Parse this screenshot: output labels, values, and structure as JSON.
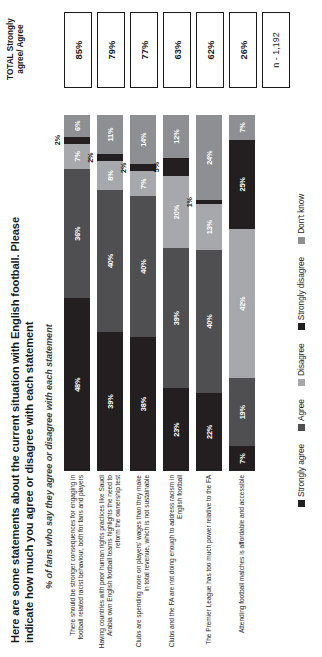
{
  "header": {
    "title": "Here are some statements about the current situation with English football. Please indicate how much you agree or disagree with each statement",
    "subtitle": "% of fans who say they agree or disagree with each statement",
    "total_header": "TOTAL Strongly agree/ Agree",
    "sample": "n - 1,192"
  },
  "legend": [
    {
      "label": "Strongly agree",
      "color": "#231f20"
    },
    {
      "label": "Agree",
      "color": "#4f4f51"
    },
    {
      "label": "Disagree",
      "color": "#a6a8ab"
    },
    {
      "label": "Strongly disagree",
      "color": "#231f20"
    },
    {
      "label": "Don't know",
      "color": "#8d8f92"
    }
  ],
  "chart_data": {
    "type": "bar",
    "orientation": "horizontal-stacked",
    "title": "Here are some statements about the current situation with English football. Please indicate how much you agree or disagree with each statement",
    "subtitle": "% of fans who say they agree or disagree with each statement",
    "xlabel": "",
    "ylabel": "",
    "xlim": [
      0,
      100
    ],
    "grid": false,
    "legend_position": "bottom",
    "series": [
      {
        "name": "Strongly agree",
        "color": "#231f20"
      },
      {
        "name": "Agree",
        "color": "#4f4f51"
      },
      {
        "name": "Disagree",
        "color": "#a6a8ab"
      },
      {
        "name": "Strongly disagree",
        "color": "#231f20"
      },
      {
        "name": "Don't know",
        "color": "#8d8f92"
      }
    ],
    "categories": [
      "There should be stronger consequences for engaging in football related racist behaviour, both for fans and players",
      "Having countries with poor human rights practices like Saudi Arabia own English football teams highlights the need to reform the ownership test",
      "Clubs are spending more on players' wages than they make in total revenue, which is not sustainable",
      "Clubs and the FA are not doing enough to address racism in English football",
      "The Premier League has too much power relative to the FA",
      "Attending football matches is affordable and accessible"
    ],
    "rows": [
      {
        "label": "There should be stronger consequences for engaging in football related racist behaviour, both for fans and players",
        "total": "85%",
        "segments": [
          {
            "key": "strongly_agree",
            "value": 48,
            "text": "48%"
          },
          {
            "key": "agree",
            "value": 36,
            "text": "36%"
          },
          {
            "key": "disagree",
            "value": 7,
            "text": "7%"
          },
          {
            "key": "strongly_disagree",
            "value": 2,
            "text": "2%"
          },
          {
            "key": "dont_know",
            "value": 6,
            "text": "6%"
          }
        ]
      },
      {
        "label": "Having countries with poor human rights practices like Saudi Arabia own English football teams highlights the need to reform the ownership test",
        "total": "79%",
        "segments": [
          {
            "key": "strongly_agree",
            "value": 39,
            "text": "39%"
          },
          {
            "key": "agree",
            "value": 40,
            "text": "40%"
          },
          {
            "key": "disagree",
            "value": 8,
            "text": "8%"
          },
          {
            "key": "strongly_disagree",
            "value": 2,
            "text": "2%"
          },
          {
            "key": "dont_know",
            "value": 11,
            "text": "11%"
          }
        ]
      },
      {
        "label": "Clubs are spending more on players' wages than they make in total revenue, which is not sustainable",
        "total": "77%",
        "segments": [
          {
            "key": "strongly_agree",
            "value": 38,
            "text": "38%"
          },
          {
            "key": "agree",
            "value": 40,
            "text": "40%"
          },
          {
            "key": "disagree",
            "value": 7,
            "text": "7%"
          },
          {
            "key": "strongly_disagree",
            "value": 2,
            "text": "2%"
          },
          {
            "key": "dont_know",
            "value": 14,
            "text": "14%"
          }
        ]
      },
      {
        "label": "Clubs and the FA are not doing enough to address racism in English football",
        "total": "63%",
        "segments": [
          {
            "key": "strongly_agree",
            "value": 23,
            "text": "23%"
          },
          {
            "key": "agree",
            "value": 39,
            "text": "39%"
          },
          {
            "key": "disagree",
            "value": 20,
            "text": "20%"
          },
          {
            "key": "strongly_disagree",
            "value": 5,
            "text": "5%"
          },
          {
            "key": "dont_know",
            "value": 12,
            "text": "12%"
          }
        ]
      },
      {
        "label": "The Premier League has too much power relative to the FA",
        "total": "62%",
        "segments": [
          {
            "key": "strongly_agree",
            "value": 22,
            "text": "22%"
          },
          {
            "key": "agree",
            "value": 40,
            "text": "40%"
          },
          {
            "key": "disagree",
            "value": 13,
            "text": "13%"
          },
          {
            "key": "strongly_disagree",
            "value": 1,
            "text": "1%"
          },
          {
            "key": "dont_know",
            "value": 24,
            "text": "24%"
          }
        ]
      },
      {
        "label": "Attending football matches is affordable and accessible",
        "total": "26%",
        "segments": [
          {
            "key": "strongly_agree",
            "value": 7,
            "text": "7%"
          },
          {
            "key": "agree",
            "value": 19,
            "text": "19%"
          },
          {
            "key": "disagree",
            "value": 42,
            "text": "42%"
          },
          {
            "key": "strongly_disagree",
            "value": 25,
            "text": "25%"
          },
          {
            "key": "dont_know",
            "value": 7,
            "text": "7%"
          }
        ]
      }
    ]
  }
}
